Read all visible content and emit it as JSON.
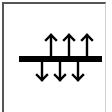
{
  "icon": {
    "name": "bidirectional-flow-through-plane",
    "colors": {
      "stroke": "#000000",
      "frame": "#555555",
      "background": "#ffffff"
    },
    "bar": {
      "x1": 19,
      "x2": 102,
      "y": 59,
      "thickness": 6
    },
    "up_arrows_x": [
      51,
      69,
      87
    ],
    "down_arrows_x": [
      42,
      60,
      78
    ]
  }
}
